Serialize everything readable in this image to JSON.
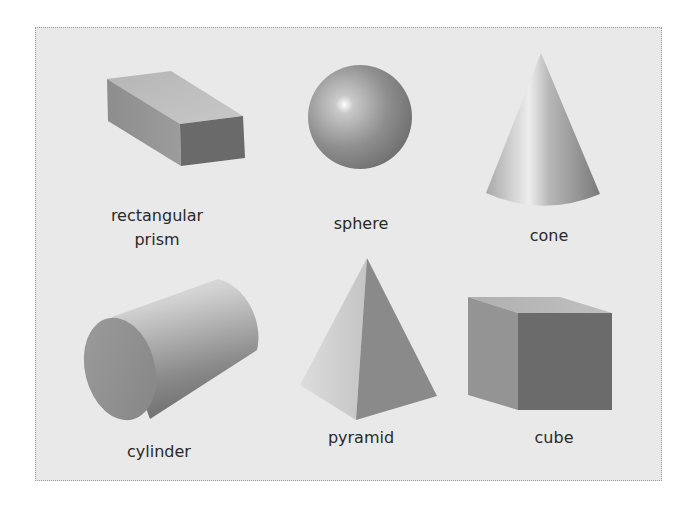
{
  "figure": {
    "background_color": "#e9e9e9",
    "shapes": [
      {
        "id": "rectangular-prism",
        "label_line1": "rectangular",
        "label_line2": "prism"
      },
      {
        "id": "sphere",
        "label": "sphere"
      },
      {
        "id": "cone",
        "label": "cone"
      },
      {
        "id": "cylinder",
        "label": "cylinder"
      },
      {
        "id": "pyramid",
        "label": "pyramid"
      },
      {
        "id": "cube",
        "label": "cube"
      }
    ]
  }
}
